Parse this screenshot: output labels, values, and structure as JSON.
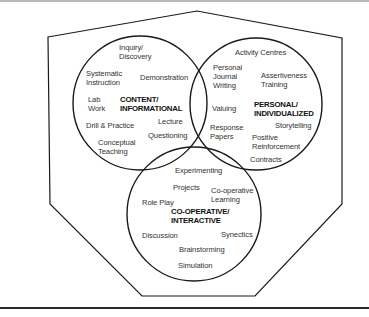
{
  "diagram": {
    "type": "venn",
    "colors": {
      "stroke": "#1a1a1a",
      "text": "#333333",
      "heading": "#111111",
      "background": "#ffffff",
      "top_rule": "#b8b8b8"
    },
    "circles": [
      {
        "id": "content",
        "heading": [
          "CONTENT/",
          "INFORMATIONAL"
        ],
        "items": [
          [
            "Inquiry/",
            "Discovery"
          ],
          [
            "Systematic",
            "Instruction"
          ],
          [
            "Demonstration"
          ],
          [
            "Lab",
            "Work"
          ],
          [
            "Drill & Practice"
          ],
          [
            "Lecture"
          ],
          [
            "Questioning"
          ],
          [
            "Conceptual",
            "Teaching"
          ]
        ]
      },
      {
        "id": "personal",
        "heading": [
          "PERSONAL/",
          "INDIVIDUALIZED"
        ],
        "items": [
          [
            "Activity Centres"
          ],
          [
            "Personal",
            "Journal",
            "Writing"
          ],
          [
            "Assertiveness",
            "Training"
          ],
          [
            "Valuing"
          ],
          [
            "Response",
            "Papers"
          ],
          [
            "Storytelling"
          ],
          [
            "Positive",
            "Reinforcement"
          ],
          [
            "Contracts"
          ]
        ]
      },
      {
        "id": "cooperative",
        "heading": [
          "CO-OPERATIVE/",
          "INTERACTIVE"
        ],
        "items": [
          [
            "Experimenting"
          ],
          [
            "Projects"
          ],
          [
            "Co-operative",
            "Learning"
          ],
          [
            "Role Play"
          ],
          [
            "Discussion"
          ],
          [
            "Synectics"
          ],
          [
            "Brainstorming"
          ],
          [
            "Simulation"
          ]
        ]
      }
    ]
  }
}
